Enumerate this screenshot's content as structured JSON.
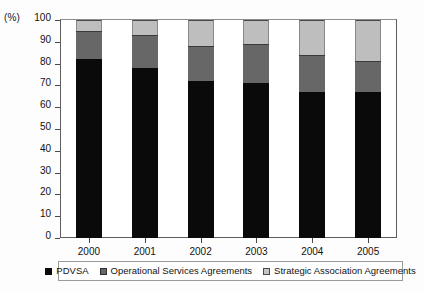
{
  "chart_data": {
    "type": "bar",
    "stacked": true,
    "title": "",
    "subtitle": "",
    "xlabel": "",
    "ylabel": "(%)",
    "unit_label": "(%)",
    "categories": [
      "2000",
      "2001",
      "2002",
      "2003",
      "2004",
      "2005"
    ],
    "ylim": [
      0,
      100
    ],
    "ytick_labels": [
      "0",
      "10",
      "20",
      "30",
      "40",
      "50",
      "60",
      "70",
      "80",
      "90",
      "100"
    ],
    "ytick_values": [
      0,
      10,
      20,
      30,
      40,
      50,
      60,
      70,
      80,
      90,
      100
    ],
    "grid": false,
    "legend_position": "bottom",
    "series": [
      {
        "name": "PDVSA",
        "color": "#0a0a0a",
        "values": [
          82,
          78,
          72,
          71,
          67,
          67
        ]
      },
      {
        "name": "Operational Services Agreements",
        "color": "#676767",
        "values": [
          13,
          15,
          16,
          18,
          17,
          14
        ]
      },
      {
        "name": "Strategic Association Agreements",
        "color": "#bebebe",
        "values": [
          5,
          7,
          12,
          11,
          16,
          19
        ]
      }
    ],
    "cumulative_tops": [
      [
        82,
        95,
        100
      ],
      [
        78,
        93,
        100
      ],
      [
        72,
        88,
        100
      ],
      [
        71,
        89,
        100
      ],
      [
        67,
        84,
        100
      ],
      [
        67,
        81,
        100
      ]
    ]
  },
  "legend": {
    "items": [
      {
        "label": "PDVSA"
      },
      {
        "label": "Operational Services Agreements"
      },
      {
        "label": "Strategic Association Agreements"
      }
    ]
  }
}
